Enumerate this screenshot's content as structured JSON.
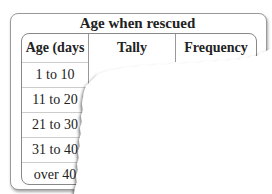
{
  "table": {
    "caption": "Age when rescued",
    "columns": [
      "Age (days",
      "Tally",
      "Frequency"
    ],
    "rows": [
      {
        "age": "1 to 10",
        "tally": "",
        "frequency": ""
      },
      {
        "age": "11 to 20",
        "tally": "",
        "frequency": ""
      },
      {
        "age": "21 to 30",
        "tally": "",
        "frequency": ""
      },
      {
        "age": "31 to 40",
        "tally": "",
        "frequency": ""
      },
      {
        "age": "over 40",
        "tally": "",
        "frequency": ""
      }
    ]
  }
}
